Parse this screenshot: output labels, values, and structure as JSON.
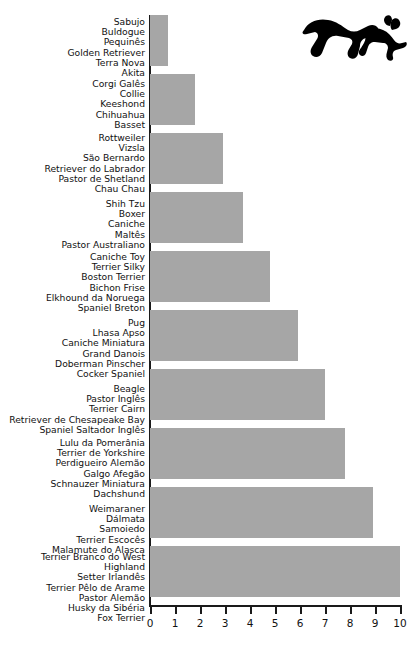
{
  "decoration": {
    "icon": "dog-silhouette-icon"
  },
  "chart_data": {
    "type": "bar",
    "orientation": "horizontal",
    "title": "",
    "xlabel": "",
    "ylabel": "",
    "xlim": [
      0,
      10
    ],
    "grid": false,
    "legend": null,
    "bar_color": "#a6a6a6",
    "axis_color": "#1a1a1a",
    "xticks": [
      "0",
      "1",
      "2",
      "3",
      "4",
      "5",
      "6",
      "7",
      "8",
      "9",
      "10"
    ],
    "xtick_values": [
      0,
      1,
      2,
      3,
      4,
      5,
      6,
      7,
      8,
      9,
      10
    ],
    "categories": [
      [
        "Sabujo",
        "Buldogue",
        "Pequinês",
        "Golden Retriever",
        "Terra Nova",
        "Akita"
      ],
      [
        "Corgi Galês",
        "Collie",
        "Keeshond",
        "Chihuahua",
        "Basset"
      ],
      [
        "Rottweiler",
        "Vizsla",
        "São Bernardo",
        "Retriever do Labrador",
        "Pastor de Shetland",
        "Chau Chau"
      ],
      [
        "Shih Tzu",
        "Boxer",
        "Caniche",
        "Maltês",
        "Pastor Australiano"
      ],
      [
        "Caniche Toy",
        "Terrier Silky",
        "Boston Terrier",
        "Bichon Frise",
        "Elkhound da Noruega",
        "Spaniel Breton"
      ],
      [
        "Pug",
        "Lhasa Apso",
        "Caniche Miniatura",
        "Grand Danois",
        "Doberman Pinscher",
        "Cocker Spaniel"
      ],
      [
        "Beagle",
        "Pastor Inglês",
        "Terrier Cairn",
        "Retriever de Chesapeake Bay",
        "Spaniel Saltador Inglês"
      ],
      [
        "Lulu da Pomerânia",
        "Terrier de Yorkshire",
        "Perdigueiro Alemão",
        "Galgo Afegão",
        "Schnauzer Miniatura",
        "Dachshund"
      ],
      [
        "Weimaraner",
        "Dálmata",
        "Samoiedo",
        "Terrier Escocês",
        "Malamute do Alasca"
      ],
      [
        "Terrier Branco do West",
        "Highland",
        "Setter Irlandês",
        "Terrier Pêlo de Arame",
        "Pastor Alemão",
        "Husky da Sibéria",
        "Fox Terrier"
      ]
    ],
    "values": [
      0.7,
      1.8,
      2.9,
      3.7,
      4.8,
      5.9,
      7.0,
      7.8,
      8.9,
      10.0
    ]
  }
}
